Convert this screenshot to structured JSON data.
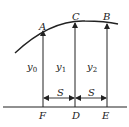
{
  "diagram": {
    "colors": {
      "stroke": "#222222",
      "background": "#ffffff"
    },
    "points": {
      "A": "A",
      "B": "B",
      "C": "C",
      "D": "D",
      "E": "E",
      "F": "F"
    },
    "ordinates": [
      {
        "base": "y",
        "sub": "0"
      },
      {
        "base": "y",
        "sub": "1"
      },
      {
        "base": "y",
        "sub": "2"
      }
    ],
    "spacing": [
      "S",
      "S"
    ]
  }
}
